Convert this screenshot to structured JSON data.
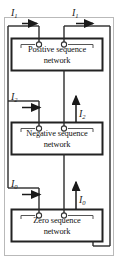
{
  "diagram": {
    "frame": {
      "name": "outer-frame",
      "color": "#b9b9b9"
    },
    "line_color": "#2b2b2b",
    "networks": [
      {
        "id": "positive",
        "line1": "Positive sequence",
        "line2": "network",
        "current_label": "I",
        "current_sub": "1",
        "left_label": "I",
        "left_sub": "1",
        "right_label": "I",
        "right_sub": "1"
      },
      {
        "id": "negative",
        "line1": "Negative sequence",
        "line2": "network",
        "current_label": "I",
        "current_sub": "2",
        "left_label": "I",
        "left_sub": "2",
        "right_label": "I",
        "right_sub": "2"
      },
      {
        "id": "zero",
        "line1": "Zero sequence",
        "line2": "network",
        "current_label": "I",
        "current_sub": "0",
        "left_label": "I",
        "left_sub": "0",
        "right_label": "I",
        "right_sub": "0"
      }
    ],
    "arrows": [
      {
        "name": "top-left-current-arrow",
        "direction": "right"
      },
      {
        "name": "top-right-current-arrow",
        "direction": "right"
      },
      {
        "name": "negative-left-current-arrow",
        "direction": "right"
      },
      {
        "name": "negative-right-current-arrow",
        "direction": "up"
      },
      {
        "name": "zero-left-current-arrow",
        "direction": "right"
      },
      {
        "name": "zero-right-current-arrow",
        "direction": "up"
      }
    ]
  }
}
